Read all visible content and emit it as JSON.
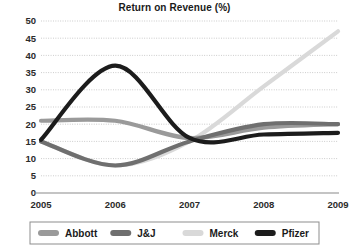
{
  "title": "Return on Revenue (%)",
  "legend": {
    "position": "bottom",
    "items": [
      {
        "label": "Abbott",
        "color": "#9a9a9a"
      },
      {
        "label": "J&J",
        "color": "#6f6f6f"
      },
      {
        "label": "Merck",
        "color": "#d9d9d9"
      },
      {
        "label": "Pfizer",
        "color": "#1c1c1c"
      }
    ]
  },
  "axes": {
    "x_ticks": [
      "2005",
      "2006",
      "2007",
      "2008",
      "2009"
    ],
    "y_ticks": [
      "50",
      "45",
      "40",
      "35",
      "30",
      "25",
      "20",
      "15",
      "10",
      "5",
      "0"
    ]
  },
  "chart_data": {
    "type": "line",
    "title": "Return on Revenue (%)",
    "xlabel": "",
    "ylabel": "",
    "categories": [
      "2005",
      "2006",
      "2007",
      "2008",
      "2009"
    ],
    "x": [
      2005,
      2006,
      2007,
      2008,
      2009
    ],
    "ylim": [
      0,
      50
    ],
    "yticks": [
      0,
      5,
      10,
      15,
      20,
      25,
      30,
      35,
      40,
      45,
      50
    ],
    "grid": true,
    "legend_position": "bottom",
    "series": [
      {
        "name": "Abbott",
        "color": "#9a9a9a",
        "values": [
          21,
          21,
          16,
          19,
          20
        ]
      },
      {
        "name": "J&J",
        "color": "#6f6f6f",
        "values": [
          15,
          8,
          15,
          20,
          20
        ]
      },
      {
        "name": "Merck",
        "color": "#d9d9d9",
        "values": [
          15,
          8,
          15,
          31,
          47
        ]
      },
      {
        "name": "Pfizer",
        "color": "#1c1c1c",
        "values": [
          15.5,
          37,
          16,
          17,
          17.5
        ]
      }
    ]
  }
}
